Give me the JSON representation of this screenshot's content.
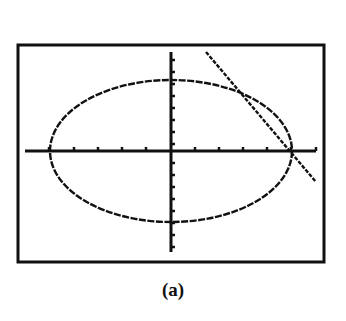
{
  "caption": "(a)",
  "colors": {
    "ink": "#111111",
    "background": "#ffffff"
  },
  "chart_data": {
    "type": "line",
    "title": "",
    "xlabel": "",
    "ylabel": "",
    "grid": false,
    "legend": null,
    "xlim": [
      -6,
      6
    ],
    "ylim": [
      -8,
      8
    ],
    "x_tick_step": 1,
    "y_tick_step": 1,
    "series": [
      {
        "name": "ellipse",
        "kind": "ellipse",
        "center": [
          0,
          0
        ],
        "semi_axis_x": 5,
        "semi_axis_y": 6,
        "description": "Ellipse x^2/25 + y^2/36 = 1 (graphing-calculator pixel style)"
      },
      {
        "name": "tangent/secant line",
        "kind": "line",
        "points": [
          [
            1.46,
            8.25
          ],
          [
            5.0,
            0.0
          ],
          [
            6.0,
            -2.6
          ]
        ],
        "description": "Decreasing line crossing the ellipse in the upper-right and at the x-intercept (5, 0)"
      }
    ],
    "annotations": [
      "(a)"
    ]
  },
  "geometry": {
    "frame": {
      "x": 18,
      "y": 45,
      "w": 306,
      "h": 217
    },
    "origin": {
      "x": 171,
      "y": 151
    },
    "x_axis": {
      "x1": 25,
      "x2": 316
    },
    "y_axis": {
      "y1": 52,
      "y2": 252
    },
    "x_ticks": [
      49,
      74,
      98,
      122,
      146,
      195,
      219,
      243,
      267,
      291,
      316
    ],
    "y_ticks": [
      60,
      72,
      84,
      96,
      108,
      120,
      132,
      144,
      163,
      175,
      187,
      199,
      211,
      223,
      235,
      247
    ],
    "ellipse": {
      "cx": 171,
      "cy": 151,
      "rx": 121,
      "ry": 71
    },
    "line": {
      "x1": 206,
      "y1": 52,
      "x2": 316,
      "y2": 182
    }
  }
}
